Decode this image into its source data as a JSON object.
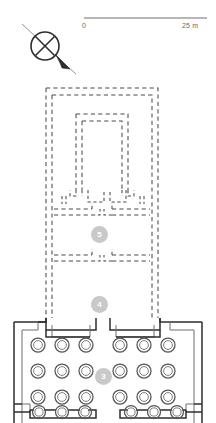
{
  "figure": {
    "kind": "archaeological-temple-plan",
    "background_color": "#ffffff",
    "line_color": "#3a3a3a",
    "dashed_color": "#4a4a4a",
    "tag_fill": "#c9c9c9",
    "tag_text_color": "#ffffff"
  },
  "scale_bar": {
    "name": "scale-bar",
    "zero_label": "0",
    "max_label": "25 m",
    "unit": "m",
    "length_value": 25,
    "bar_x_start": 84,
    "bar_x_end": 207,
    "bar_y": 18
  },
  "north_indicator": {
    "name": "north-arrow",
    "type": "crossed-circle-with-diagonal-arrow",
    "center_x": 45,
    "center_y": 46,
    "radius": 14,
    "arrow_direction": "southeast"
  },
  "room_tags": [
    {
      "id": "tag-5",
      "label": "5",
      "cx": 100,
      "cy": 235,
      "name": "room-label-5"
    },
    {
      "id": "tag-4",
      "label": "4",
      "cx": 100,
      "cy": 305,
      "name": "room-label-4"
    },
    {
      "id": "tag-3",
      "label": "3",
      "cx": 104,
      "cy": 377,
      "name": "room-label-3"
    }
  ],
  "structures": {
    "outer_dashed_court": {
      "name": "outer-dashed-enclosure",
      "style": "dashed-double-line",
      "x": 46,
      "y": 88,
      "width": 112,
      "height": 230
    },
    "inner_dashed_room": {
      "name": "inner-dashed-sanctuary",
      "style": "dashed-double-line",
      "x": 76,
      "y": 114,
      "width": 52,
      "height": 80
    },
    "transverse_hall": {
      "name": "transverse-hall-room-5",
      "style": "dashed-double-line",
      "x": 54,
      "y": 209,
      "width": 96,
      "height": 52
    },
    "court_4": {
      "name": "open-court-room-4",
      "style": "dashed-double-line",
      "x": 46,
      "y": 261,
      "width": 112,
      "height": 57
    },
    "hypostyle_hall": {
      "name": "hypostyle-hall-room-3",
      "style": "solid-thick-wall",
      "x": 14,
      "y": 318,
      "width": 190,
      "height": 105
    }
  },
  "columns": {
    "name": "column-grid",
    "count": 24,
    "rows": 4,
    "columns_per_row": 6,
    "symbol": "double-circle",
    "outer_radius": 7,
    "inner_radius": 4.4,
    "x_positions": [
      38,
      62,
      86,
      120,
      144,
      168
    ],
    "y_positions": [
      345,
      371,
      397,
      414
    ],
    "screen_walls_row": 4,
    "note": "bottom row columns joined by intercolumnar screen walls"
  }
}
